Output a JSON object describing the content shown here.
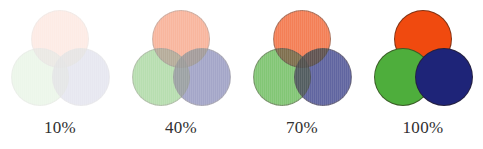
{
  "figure": {
    "background_color": "#FFFFFF",
    "blend_mode": "multiply"
  },
  "palette": {
    "orange": "#F04A0F",
    "green": "#4EAE3C",
    "blue": "#1E2478",
    "outline": "#2A1E14",
    "caption_color": "#303030"
  },
  "shapes": [
    {
      "name": "orange-circle",
      "color_key": "orange",
      "position": "top-center"
    },
    {
      "name": "green-circle",
      "color_key": "green",
      "position": "bottom-left"
    },
    {
      "name": "blue-circle",
      "color_key": "blue",
      "position": "bottom-right"
    }
  ],
  "groups": [
    {
      "id": "opacity-10",
      "label": "10%",
      "opacity": 0.1,
      "left": 0
    },
    {
      "id": "opacity-40",
      "label": "40%",
      "opacity": 0.4,
      "left": 121
    },
    {
      "id": "opacity-70",
      "label": "70%",
      "opacity": 0.7,
      "left": 242
    },
    {
      "id": "opacity-100",
      "label": "100%",
      "opacity": 1.0,
      "left": 363
    }
  ],
  "chart_data": {
    "type": "table",
    "xlabel": "",
    "ylabel": "",
    "categories": [
      "10%",
      "40%",
      "70%",
      "100%"
    ],
    "values": [
      10,
      40,
      70,
      100
    ],
    "series": [
      {
        "name": "opacity_percent",
        "values": [
          10,
          40,
          70,
          100
        ]
      }
    ],
    "annotations": [
      "10%",
      "40%",
      "70%",
      "100%"
    ],
    "legend": [
      "orange circle",
      "green circle",
      "blue circle"
    ]
  }
}
